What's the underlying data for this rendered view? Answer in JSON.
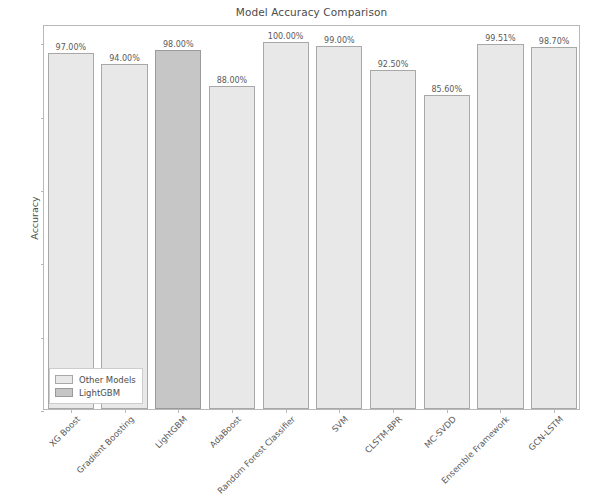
{
  "chart_data": {
    "type": "bar",
    "title": "Model Accuracy Comparison",
    "xlabel": "",
    "ylabel": "Accuracy",
    "ylim": [
      0.0,
      1.05
    ],
    "ytick_labels": [
      "0.0",
      "0.2",
      "0.4",
      "0.6",
      "0.8",
      "1.0"
    ],
    "ytick_values": [
      0.0,
      0.2,
      0.4,
      0.6,
      0.8,
      1.0
    ],
    "grid": false,
    "legend_position": "lower left",
    "categories": [
      "XG Boost",
      "Gradient Boosting",
      "LightGBM",
      "AdaBoost",
      "Random Forest Classifier",
      "SVM",
      "CLSTM-BPR",
      "MC-SVDD",
      "Ensemble Framework",
      "GCN-LSTM"
    ],
    "values": [
      0.97,
      0.94,
      0.98,
      0.88,
      1.0,
      0.99,
      0.925,
      0.856,
      0.9951,
      0.987
    ],
    "value_labels": [
      "97.00%",
      "94.00%",
      "98.00%",
      "88.00%",
      "100.00%",
      "99.00%",
      "92.50%",
      "85.60%",
      "99.51%",
      "98.70%"
    ],
    "highlight_index": 2,
    "series": [
      {
        "name": "Other Models",
        "color": "#e8e8e8",
        "edge_color": "#a8a8a8"
      },
      {
        "name": "LightGBM",
        "color": "#c6c6c6",
        "edge_color": "#9a9a9a"
      }
    ],
    "legend": [
      "Other Models",
      "LightGBM"
    ]
  }
}
